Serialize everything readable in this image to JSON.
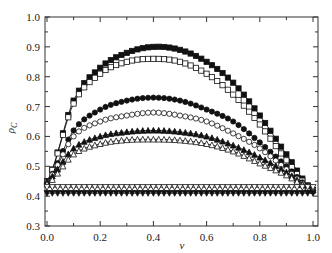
{
  "chart_data": {
    "type": "line",
    "title": "",
    "xlabel": "ν",
    "ylabel": "ρ_C",
    "xlim": [
      0.0,
      1.0
    ],
    "ylim": [
      0.3,
      1.0
    ],
    "grid": false,
    "legend": null,
    "x_ticks": [
      "0.0",
      "0.2",
      "0.4",
      "0.6",
      "0.8",
      "1.0"
    ],
    "y_ticks": [
      "0.3",
      "0.4",
      "0.5",
      "0.6",
      "0.7",
      "0.8",
      "0.9",
      "1.0"
    ],
    "x": [
      0.0,
      0.1,
      0.2,
      0.3,
      0.4,
      0.5,
      0.6,
      0.7,
      0.8,
      0.9,
      1.0
    ],
    "series": [
      {
        "name": "filled-square",
        "marker": "square",
        "filled": true,
        "values": [
          0.45,
          0.72,
          0.83,
          0.88,
          0.9,
          0.89,
          0.85,
          0.78,
          0.67,
          0.54,
          0.42
        ]
      },
      {
        "name": "open-square",
        "marker": "square",
        "filled": false,
        "values": [
          0.45,
          0.71,
          0.81,
          0.85,
          0.86,
          0.85,
          0.81,
          0.74,
          0.64,
          0.52,
          0.42
        ]
      },
      {
        "name": "filled-circle",
        "marker": "circle",
        "filled": true,
        "values": [
          0.45,
          0.62,
          0.69,
          0.72,
          0.73,
          0.72,
          0.69,
          0.65,
          0.58,
          0.5,
          0.42
        ]
      },
      {
        "name": "open-circle",
        "marker": "circle",
        "filled": false,
        "values": [
          0.45,
          0.6,
          0.65,
          0.67,
          0.68,
          0.67,
          0.65,
          0.61,
          0.56,
          0.49,
          0.42
        ]
      },
      {
        "name": "filled-triangle-up",
        "marker": "triangle-up",
        "filled": true,
        "values": [
          0.45,
          0.56,
          0.6,
          0.615,
          0.62,
          0.615,
          0.6,
          0.57,
          0.53,
          0.48,
          0.42
        ]
      },
      {
        "name": "open-triangle-up",
        "marker": "triangle-up",
        "filled": false,
        "values": [
          0.44,
          0.54,
          0.575,
          0.588,
          0.59,
          0.587,
          0.575,
          0.55,
          0.51,
          0.47,
          0.42
        ]
      },
      {
        "name": "open-triangle-down",
        "marker": "triangle-down",
        "filled": false,
        "values": [
          0.43,
          0.43,
          0.43,
          0.43,
          0.43,
          0.43,
          0.43,
          0.43,
          0.43,
          0.43,
          0.43
        ]
      },
      {
        "name": "filled-triangle-down",
        "marker": "triangle-down",
        "filled": true,
        "values": [
          0.41,
          0.41,
          0.41,
          0.41,
          0.41,
          0.41,
          0.41,
          0.41,
          0.41,
          0.41,
          0.41
        ]
      }
    ]
  }
}
